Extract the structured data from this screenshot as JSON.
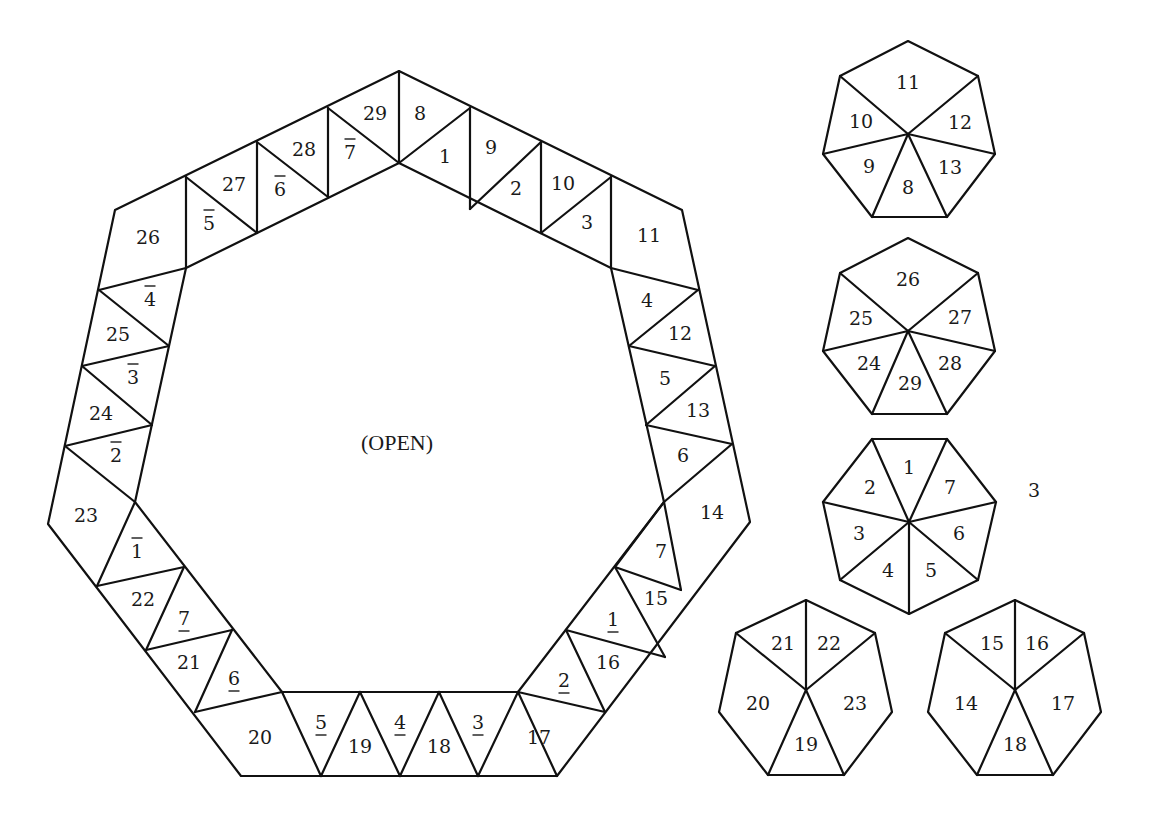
{
  "diagram": {
    "center_label": "(OPEN)",
    "side_label": "3",
    "stroke_color": "#111111",
    "background": "#ffffff"
  },
  "ring": {
    "outer": [
      [
        399,
        71
      ],
      [
        682,
        210
      ],
      [
        750,
        522
      ],
      [
        557,
        776
      ],
      [
        241,
        776
      ],
      [
        48,
        524
      ],
      [
        115,
        210
      ]
    ],
    "inner": [
      [
        399,
        163
      ],
      [
        611,
        268
      ],
      [
        664,
        502
      ],
      [
        518,
        692
      ],
      [
        282,
        692
      ],
      [
        135,
        502
      ],
      [
        186,
        268
      ]
    ],
    "segments": [
      [
        [
          399,
          71
        ],
        [
          399,
          163
        ]
      ],
      [
        [
          470,
          108
        ],
        [
          399,
          163
        ]
      ],
      [
        [
          470,
          108
        ],
        [
          470,
          209
        ]
      ],
      [
        [
          470,
          209
        ],
        [
          541,
          142
        ]
      ],
      [
        [
          541,
          142
        ],
        [
          541,
          233
        ]
      ],
      [
        [
          541,
          233
        ],
        [
          611,
          177
        ]
      ],
      [
        [
          611,
          177
        ],
        [
          611,
          268
        ]
      ],
      [
        [
          611,
          268
        ],
        [
          698,
          290
        ]
      ],
      [
        [
          698,
          290
        ],
        [
          629,
          346
        ]
      ],
      [
        [
          629,
          346
        ],
        [
          715,
          366
        ]
      ],
      [
        [
          715,
          366
        ],
        [
          646,
          425
        ]
      ],
      [
        [
          646,
          425
        ],
        [
          732,
          444
        ]
      ],
      [
        [
          732,
          444
        ],
        [
          664,
          502
        ]
      ],
      [
        [
          664,
          502
        ],
        [
          681,
          590
        ]
      ],
      [
        [
          664,
          502
        ],
        [
          615,
          567
        ]
      ],
      [
        [
          615,
          567
        ],
        [
          681,
          590
        ]
      ],
      [
        [
          615,
          567
        ],
        [
          665,
          657
        ]
      ],
      [
        [
          665,
          657
        ],
        [
          566,
          630
        ]
      ],
      [
        [
          566,
          630
        ],
        [
          605,
          712
        ]
      ],
      [
        [
          605,
          712
        ],
        [
          518,
          692
        ]
      ],
      [
        [
          518,
          692
        ],
        [
          557,
          776
        ]
      ],
      [
        [
          518,
          692
        ],
        [
          478,
          776
        ]
      ],
      [
        [
          478,
          776
        ],
        [
          439,
          692
        ]
      ],
      [
        [
          439,
          692
        ],
        [
          400,
          776
        ]
      ],
      [
        [
          400,
          776
        ],
        [
          360,
          692
        ]
      ],
      [
        [
          360,
          692
        ],
        [
          321,
          776
        ]
      ],
      [
        [
          321,
          776
        ],
        [
          282,
          692
        ]
      ],
      [
        [
          282,
          692
        ],
        [
          195,
          712
        ]
      ],
      [
        [
          195,
          712
        ],
        [
          232,
          630
        ]
      ],
      [
        [
          232,
          630
        ],
        [
          146,
          650
        ]
      ],
      [
        [
          146,
          650
        ],
        [
          184,
          567
        ]
      ],
      [
        [
          184,
          567
        ],
        [
          97,
          586
        ]
      ],
      [
        [
          97,
          586
        ],
        [
          135,
          502
        ]
      ],
      [
        [
          135,
          502
        ],
        [
          65,
          446
        ]
      ],
      [
        [
          65,
          446
        ],
        [
          152,
          425
        ]
      ],
      [
        [
          152,
          425
        ],
        [
          82,
          366
        ]
      ],
      [
        [
          82,
          366
        ],
        [
          169,
          346
        ]
      ],
      [
        [
          169,
          346
        ],
        [
          99,
          290
        ]
      ],
      [
        [
          99,
          290
        ],
        [
          186,
          268
        ]
      ],
      [
        [
          186,
          177
        ],
        [
          186,
          268
        ]
      ],
      [
        [
          186,
          177
        ],
        [
          257,
          233
        ]
      ],
      [
        [
          257,
          233
        ],
        [
          257,
          142
        ]
      ],
      [
        [
          257,
          142
        ],
        [
          328,
          197
        ]
      ],
      [
        [
          328,
          197
        ],
        [
          328,
          108
        ]
      ],
      [
        [
          328,
          108
        ],
        [
          399,
          163
        ]
      ]
    ],
    "labels": [
      {
        "text": "8",
        "x": 420,
        "y": 113,
        "mark": ""
      },
      {
        "text": "1",
        "x": 445,
        "y": 156,
        "mark": ""
      },
      {
        "text": "9",
        "x": 491,
        "y": 147,
        "mark": ""
      },
      {
        "text": "2",
        "x": 516,
        "y": 188,
        "mark": ""
      },
      {
        "text": "10",
        "x": 563,
        "y": 183,
        "mark": ""
      },
      {
        "text": "3",
        "x": 587,
        "y": 222,
        "mark": ""
      },
      {
        "text": "11",
        "x": 649,
        "y": 235,
        "mark": ""
      },
      {
        "text": "4",
        "x": 647,
        "y": 300,
        "mark": ""
      },
      {
        "text": "12",
        "x": 680,
        "y": 333,
        "mark": ""
      },
      {
        "text": "5",
        "x": 665,
        "y": 378,
        "mark": ""
      },
      {
        "text": "13",
        "x": 698,
        "y": 410,
        "mark": ""
      },
      {
        "text": "6",
        "x": 683,
        "y": 455,
        "mark": ""
      },
      {
        "text": "14",
        "x": 712,
        "y": 512,
        "mark": ""
      },
      {
        "text": "7",
        "x": 661,
        "y": 551,
        "mark": ""
      },
      {
        "text": "15",
        "x": 656,
        "y": 598,
        "mark": ""
      },
      {
        "text": "1",
        "x": 613,
        "y": 619,
        "mark": "under"
      },
      {
        "text": "16",
        "x": 608,
        "y": 662,
        "mark": ""
      },
      {
        "text": "2",
        "x": 564,
        "y": 680,
        "mark": "under"
      },
      {
        "text": "17",
        "x": 539,
        "y": 737,
        "mark": ""
      },
      {
        "text": "3",
        "x": 478,
        "y": 722,
        "mark": "under"
      },
      {
        "text": "18",
        "x": 439,
        "y": 746,
        "mark": ""
      },
      {
        "text": "4",
        "x": 400,
        "y": 722,
        "mark": "under"
      },
      {
        "text": "19",
        "x": 360,
        "y": 746,
        "mark": ""
      },
      {
        "text": "5",
        "x": 321,
        "y": 722,
        "mark": "under"
      },
      {
        "text": "20",
        "x": 260,
        "y": 737,
        "mark": ""
      },
      {
        "text": "6",
        "x": 234,
        "y": 678,
        "mark": "under"
      },
      {
        "text": "21",
        "x": 189,
        "y": 662,
        "mark": ""
      },
      {
        "text": "7",
        "x": 184,
        "y": 618,
        "mark": "under"
      },
      {
        "text": "22",
        "x": 143,
        "y": 599,
        "mark": ""
      },
      {
        "text": "1",
        "x": 137,
        "y": 551,
        "mark": "over"
      },
      {
        "text": "23",
        "x": 86,
        "y": 515,
        "mark": ""
      },
      {
        "text": "2",
        "x": 116,
        "y": 455,
        "mark": "over"
      },
      {
        "text": "24",
        "x": 101,
        "y": 413,
        "mark": ""
      },
      {
        "text": "3",
        "x": 133,
        "y": 377,
        "mark": "over"
      },
      {
        "text": "25",
        "x": 118,
        "y": 334,
        "mark": ""
      },
      {
        "text": "4",
        "x": 150,
        "y": 299,
        "mark": "over"
      },
      {
        "text": "26",
        "x": 148,
        "y": 237,
        "mark": ""
      },
      {
        "text": "5",
        "x": 209,
        "y": 223,
        "mark": "over"
      },
      {
        "text": "27",
        "x": 234,
        "y": 184,
        "mark": ""
      },
      {
        "text": "6",
        "x": 280,
        "y": 189,
        "mark": "over"
      },
      {
        "text": "28",
        "x": 304,
        "y": 149,
        "mark": ""
      },
      {
        "text": "7",
        "x": 350,
        "y": 152,
        "mark": "over"
      },
      {
        "text": "29",
        "x": 375,
        "y": 113,
        "mark": ""
      }
    ]
  },
  "heptagons": [
    {
      "name": "heptagon-11",
      "center": [
        908,
        134
      ],
      "vertices": [
        [
          908,
          41
        ],
        [
          978,
          76
        ],
        [
          995,
          154
        ],
        [
          947,
          217
        ],
        [
          872,
          217
        ],
        [
          823,
          154
        ],
        [
          840,
          76
        ]
      ],
      "labels": [
        {
          "text": "11",
          "x": 908,
          "y": 82
        },
        {
          "text": "12",
          "x": 960,
          "y": 122
        },
        {
          "text": "13",
          "x": 950,
          "y": 167
        },
        {
          "text": "8",
          "x": 908,
          "y": 187
        },
        {
          "text": "9",
          "x": 869,
          "y": 166
        },
        {
          "text": "10",
          "x": 861,
          "y": 121
        }
      ],
      "spokes": [
        [
          978,
          76
        ],
        [
          995,
          154
        ],
        [
          947,
          217
        ],
        [
          872,
          217
        ],
        [
          823,
          154
        ],
        [
          840,
          76
        ]
      ]
    },
    {
      "name": "heptagon-26",
      "center": [
        908,
        331
      ],
      "vertices": [
        [
          908,
          238
        ],
        [
          978,
          273
        ],
        [
          995,
          351
        ],
        [
          947,
          414
        ],
        [
          872,
          414
        ],
        [
          823,
          351
        ],
        [
          840,
          273
        ]
      ],
      "labels": [
        {
          "text": "26",
          "x": 908,
          "y": 279
        },
        {
          "text": "27",
          "x": 960,
          "y": 317
        },
        {
          "text": "28",
          "x": 950,
          "y": 363
        },
        {
          "text": "29",
          "x": 910,
          "y": 383
        },
        {
          "text": "24",
          "x": 869,
          "y": 363
        },
        {
          "text": "25",
          "x": 861,
          "y": 318
        }
      ],
      "spokes": [
        [
          978,
          273
        ],
        [
          995,
          351
        ],
        [
          947,
          414
        ],
        [
          872,
          414
        ],
        [
          823,
          351
        ],
        [
          840,
          273
        ]
      ]
    },
    {
      "name": "heptagon-1",
      "center": [
        909,
        522
      ],
      "vertices": [
        [
          872,
          439
        ],
        [
          947,
          439
        ],
        [
          996,
          502
        ],
        [
          978,
          580
        ],
        [
          909,
          614
        ],
        [
          840,
          580
        ],
        [
          823,
          502
        ]
      ],
      "labels": [
        {
          "text": "1",
          "x": 909,
          "y": 467
        },
        {
          "text": "7",
          "x": 950,
          "y": 487
        },
        {
          "text": "6",
          "x": 959,
          "y": 533
        },
        {
          "text": "5",
          "x": 931,
          "y": 570
        },
        {
          "text": "4",
          "x": 888,
          "y": 570
        },
        {
          "text": "3",
          "x": 859,
          "y": 533
        },
        {
          "text": "2",
          "x": 870,
          "y": 487
        }
      ],
      "spokes": [
        [
          872,
          439
        ],
        [
          947,
          439
        ],
        [
          996,
          502
        ],
        [
          978,
          580
        ],
        [
          909,
          614
        ],
        [
          840,
          580
        ],
        [
          823,
          502
        ]
      ]
    },
    {
      "name": "heptagon-20",
      "center": [
        806,
        690
      ],
      "vertices": [
        [
          806,
          600
        ],
        [
          875,
          633
        ],
        [
          892,
          712
        ],
        [
          844,
          775
        ],
        [
          768,
          775
        ],
        [
          719,
          712
        ],
        [
          736,
          633
        ]
      ],
      "labels": [
        {
          "text": "21",
          "x": 783,
          "y": 643
        },
        {
          "text": "22",
          "x": 829,
          "y": 643
        },
        {
          "text": "20",
          "x": 758,
          "y": 703
        },
        {
          "text": "23",
          "x": 855,
          "y": 703
        },
        {
          "text": "19",
          "x": 806,
          "y": 744
        }
      ],
      "spokes": [
        [
          806,
          600
        ],
        [
          875,
          633
        ],
        [
          844,
          775
        ],
        [
          768,
          775
        ],
        [
          736,
          633
        ]
      ]
    },
    {
      "name": "heptagon-15",
      "center": [
        1015,
        690
      ],
      "vertices": [
        [
          1015,
          600
        ],
        [
          1084,
          633
        ],
        [
          1101,
          712
        ],
        [
          1053,
          775
        ],
        [
          977,
          775
        ],
        [
          928,
          712
        ],
        [
          945,
          633
        ]
      ],
      "labels": [
        {
          "text": "15",
          "x": 992,
          "y": 643
        },
        {
          "text": "16",
          "x": 1037,
          "y": 643
        },
        {
          "text": "14",
          "x": 966,
          "y": 703
        },
        {
          "text": "17",
          "x": 1063,
          "y": 703
        },
        {
          "text": "18",
          "x": 1015,
          "y": 744
        }
      ],
      "spokes": [
        [
          1015,
          600
        ],
        [
          1084,
          633
        ],
        [
          1053,
          775
        ],
        [
          977,
          775
        ],
        [
          945,
          633
        ]
      ]
    }
  ],
  "positions": {
    "center_label": [
      397,
      442
    ],
    "side_label": [
      1034,
      490
    ]
  }
}
